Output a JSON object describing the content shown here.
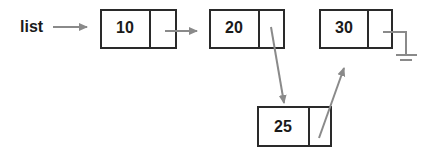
{
  "diagram": {
    "type": "linked-list-insertion",
    "pointer_label": "list",
    "nodes": [
      {
        "id": "n10",
        "value": "10"
      },
      {
        "id": "n20",
        "value": "20"
      },
      {
        "id": "n30",
        "value": "30"
      },
      {
        "id": "n25",
        "value": "25"
      }
    ],
    "edges": [
      {
        "from": "list",
        "to": "n10"
      },
      {
        "from": "n10",
        "to": "n20"
      },
      {
        "from": "n20",
        "to": "n25"
      },
      {
        "from": "n25",
        "to": "n30"
      },
      {
        "from": "n30",
        "to": "null-ground"
      }
    ],
    "colors": {
      "box_stroke": "#2a2a2a",
      "arrow": "#8a8a8a",
      "text": "#1a1a1a"
    }
  }
}
